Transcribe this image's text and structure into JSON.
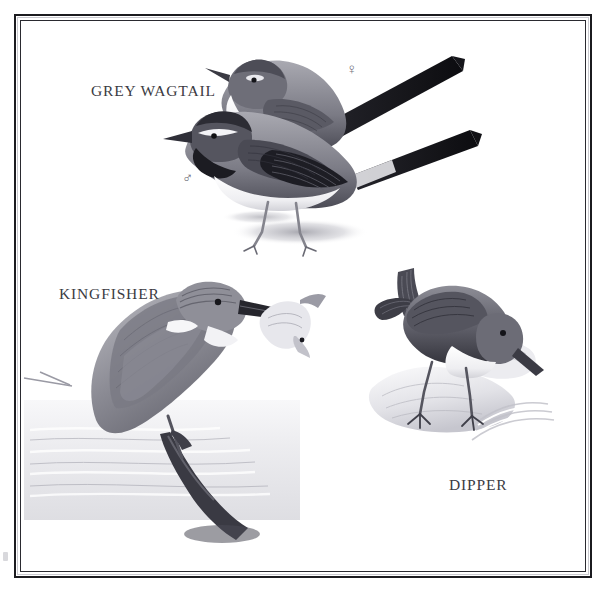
{
  "plate": {
    "type": "natural-history-illustration-plate",
    "background_color": "#ffffff",
    "frame": {
      "style": "double-rule",
      "outer_color": "#1b1b1f",
      "inner_color": "#2a2a30"
    },
    "medium": "monochrome halftone / engraving-style bird plate"
  },
  "labels": {
    "wagtail": "GREY WAGTAIL",
    "kingfisher": "KINGFISHER",
    "dipper": "DIPPER"
  },
  "symbols": {
    "female": "♀",
    "male": "♂"
  },
  "subjects": [
    {
      "name": "GREY WAGTAIL",
      "sex_marks": [
        "♀",
        "♂"
      ],
      "count": 2,
      "description": "two long-tailed wagtails with crossing tails, standing on ground with cast shadow"
    },
    {
      "name": "KINGFISHER",
      "count": 1,
      "description": "kingfisher perched on a branch above water holding a fish in its bill"
    },
    {
      "name": "DIPPER",
      "count": 1,
      "description": "dipper with cocked tail and white breast standing on a rock beside rippling water"
    }
  ],
  "palette": {
    "ink_dark": "#1b1b1f",
    "ink_mid": "#6f6f78",
    "ink_light": "#b9b9c0",
    "paper": "#ffffff",
    "label_text": "#3b3b42"
  }
}
